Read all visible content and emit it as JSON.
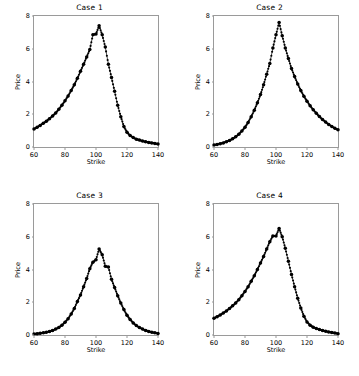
{
  "figure": {
    "background": "#ffffff",
    "rows": 2,
    "cols": 2,
    "line_color": "#000000",
    "marker_color": "#000000",
    "spine_color": "#9a9a9a"
  },
  "chart_data": [
    {
      "type": "line",
      "title": "Case 1",
      "xlabel": "Strike",
      "ylabel": "Price",
      "xlim": [
        60,
        140
      ],
      "ylim": [
        0,
        8
      ],
      "xticks": [
        60,
        80,
        100,
        120,
        140
      ],
      "yticks": [
        0,
        2,
        4,
        6,
        8
      ],
      "grid": false,
      "legend": null,
      "marker": "circle",
      "x": [
        60,
        62,
        64,
        66,
        68,
        70,
        72,
        74,
        76,
        78,
        80,
        82,
        84,
        86,
        88,
        90,
        92,
        94,
        96,
        98,
        100,
        102,
        104,
        106,
        108,
        110,
        112,
        114,
        116,
        118,
        120,
        122,
        124,
        126,
        128,
        130,
        132,
        134,
        136,
        138,
        140
      ],
      "values": [
        1.1,
        1.2,
        1.32,
        1.45,
        1.58,
        1.73,
        1.9,
        2.08,
        2.3,
        2.55,
        2.82,
        3.12,
        3.45,
        3.8,
        4.2,
        4.62,
        5.05,
        5.5,
        5.95,
        6.85,
        6.9,
        7.4,
        6.85,
        6.1,
        5.05,
        4.25,
        3.4,
        2.55,
        1.85,
        1.25,
        0.9,
        0.7,
        0.58,
        0.48,
        0.42,
        0.36,
        0.32,
        0.28,
        0.25,
        0.22,
        0.18
      ]
    },
    {
      "type": "line",
      "title": "Case 2",
      "xlabel": "Strike",
      "ylabel": "Price",
      "xlim": [
        60,
        140
      ],
      "ylim": [
        0,
        8
      ],
      "xticks": [
        60,
        80,
        100,
        120,
        140
      ],
      "yticks": [
        0,
        2,
        4,
        6,
        8
      ],
      "grid": false,
      "legend": null,
      "marker": "circle",
      "x": [
        60,
        62,
        64,
        66,
        68,
        70,
        72,
        74,
        76,
        78,
        80,
        82,
        84,
        86,
        88,
        90,
        92,
        94,
        96,
        98,
        100,
        102,
        104,
        106,
        108,
        110,
        112,
        114,
        116,
        118,
        120,
        122,
        124,
        126,
        128,
        130,
        132,
        134,
        136,
        138,
        140
      ],
      "values": [
        0.12,
        0.16,
        0.2,
        0.25,
        0.32,
        0.4,
        0.5,
        0.62,
        0.78,
        0.98,
        1.2,
        1.5,
        1.85,
        2.25,
        2.7,
        3.2,
        3.8,
        4.45,
        5.1,
        6.05,
        6.85,
        7.6,
        6.8,
        6.05,
        5.4,
        4.8,
        4.3,
        3.85,
        3.45,
        3.1,
        2.8,
        2.52,
        2.28,
        2.06,
        1.86,
        1.68,
        1.52,
        1.38,
        1.25,
        1.14,
        1.05
      ]
    },
    {
      "type": "line",
      "title": "Case 3",
      "xlabel": "Strike",
      "ylabel": "Price",
      "xlim": [
        60,
        140
      ],
      "ylim": [
        0,
        8
      ],
      "xticks": [
        60,
        80,
        100,
        120,
        140
      ],
      "yticks": [
        0,
        2,
        4,
        6,
        8
      ],
      "grid": false,
      "legend": null,
      "marker": "circle",
      "x": [
        60,
        62,
        64,
        66,
        68,
        70,
        72,
        74,
        76,
        78,
        80,
        82,
        84,
        86,
        88,
        90,
        92,
        94,
        96,
        98,
        100,
        102,
        104,
        106,
        108,
        110,
        112,
        114,
        116,
        118,
        120,
        122,
        124,
        126,
        128,
        130,
        132,
        134,
        136,
        138,
        140
      ],
      "values": [
        0.06,
        0.08,
        0.1,
        0.13,
        0.17,
        0.22,
        0.28,
        0.36,
        0.46,
        0.6,
        0.78,
        1.0,
        1.28,
        1.62,
        2.05,
        2.45,
        2.95,
        3.45,
        4.05,
        4.45,
        4.6,
        5.25,
        4.9,
        4.2,
        4.15,
        3.4,
        2.9,
        2.4,
        1.95,
        1.55,
        1.2,
        0.95,
        0.74,
        0.58,
        0.46,
        0.36,
        0.28,
        0.22,
        0.17,
        0.13,
        0.09
      ]
    },
    {
      "type": "line",
      "title": "Case 4",
      "xlabel": "Strike",
      "ylabel": "Price",
      "xlim": [
        60,
        140
      ],
      "ylim": [
        0,
        8
      ],
      "xticks": [
        60,
        80,
        100,
        120,
        140
      ],
      "yticks": [
        0,
        2,
        4,
        6,
        8
      ],
      "grid": false,
      "legend": null,
      "marker": "circle",
      "x": [
        60,
        62,
        64,
        66,
        68,
        70,
        72,
        74,
        76,
        78,
        80,
        82,
        84,
        86,
        88,
        90,
        92,
        94,
        96,
        98,
        100,
        102,
        104,
        106,
        108,
        110,
        112,
        114,
        116,
        118,
        120,
        122,
        124,
        126,
        128,
        130,
        132,
        134,
        136,
        138,
        140
      ],
      "values": [
        1.02,
        1.12,
        1.22,
        1.34,
        1.47,
        1.62,
        1.78,
        1.96,
        2.16,
        2.4,
        2.66,
        2.95,
        3.28,
        3.62,
        4.0,
        4.4,
        4.8,
        5.25,
        5.7,
        6.05,
        6.05,
        6.5,
        6.0,
        5.3,
        4.5,
        3.7,
        2.95,
        2.25,
        1.65,
        1.15,
        0.8,
        0.6,
        0.48,
        0.4,
        0.33,
        0.28,
        0.23,
        0.19,
        0.15,
        0.12,
        0.08
      ]
    }
  ]
}
